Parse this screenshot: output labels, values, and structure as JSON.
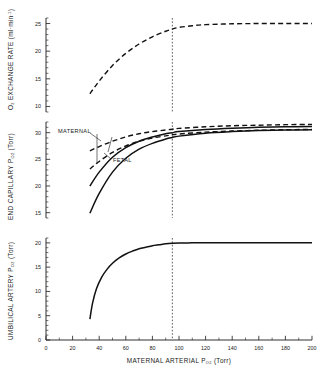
{
  "figure": {
    "name": "maternal-fetal-oxygen-transfer-figure",
    "background": "#ffffff",
    "ink": "#111111"
  },
  "xaxis": {
    "label_main": "MATERNAL ARTERIAL P",
    "label_sub": "O",
    "label_sub2": "2",
    "label_unit": "(Torr)",
    "full_label": "MATERNAL ARTERIAL PO2 (Torr)",
    "min": 0,
    "max": 200,
    "ticks": [
      0,
      20,
      40,
      60,
      80,
      100,
      120,
      140,
      160,
      180,
      200
    ],
    "tick_labels": [
      "0",
      "20",
      "40",
      "60",
      "80",
      "100",
      "120",
      "140",
      "160",
      "180",
      "200"
    ],
    "minor_step": 10
  },
  "reference_line": {
    "name": "normal-maternal-po2-reference",
    "x": 95,
    "style": "dotted"
  },
  "panels": [
    {
      "id": "top",
      "name": "o2-exchange-rate-panel",
      "ylabel_main": "O",
      "ylabel_sub": "2",
      "ylabel_rest": " EXCHANGE RATE (ml",
      "ylabel_unit": "min",
      "ylabel_exp": "-1",
      "ylabel_tail": ")",
      "full_ylabel": "O2 EXCHANGE RATE (ml·min-1)",
      "ymin": 9,
      "ymax": 26,
      "ticks": [
        10,
        15,
        20,
        25
      ],
      "tick_labels": [
        "10",
        "15",
        "20",
        "25"
      ],
      "minor_step": 1
    },
    {
      "id": "middle",
      "name": "end-capillary-po2-panel",
      "ylabel_main": "END CAPILLARY P",
      "ylabel_sub": "O",
      "ylabel_sub2": "2",
      "ylabel_unit": "(Torr)",
      "full_ylabel": "END CAPILLARY PO2 (Torr)",
      "ymin": 14,
      "ymax": 32,
      "ticks": [
        15,
        20,
        25,
        30
      ],
      "tick_labels": [
        "15",
        "20",
        "25",
        "30"
      ],
      "minor_step": 1
    },
    {
      "id": "bottom",
      "name": "umbilical-artery-po2-panel",
      "ylabel_main": "UMBILICAL ARTERY P",
      "ylabel_sub": "O",
      "ylabel_sub2": "2",
      "ylabel_unit": "(Torr)",
      "full_ylabel": "UMBILICAL ARTERY PO2 (Torr)",
      "ymin": 0,
      "ymax": 21,
      "ticks": [
        0,
        5,
        10,
        15,
        20
      ],
      "tick_labels": [
        "0",
        "5",
        "10",
        "15",
        "20"
      ],
      "minor_step": 1
    }
  ],
  "annotations": [
    {
      "name": "maternal-label",
      "text": "MATERNAL",
      "x": 58,
      "y": 131
    },
    {
      "name": "fetal-label",
      "text": "FETAL",
      "x": 113,
      "y": 160
    }
  ],
  "chart_data": {
    "type": "line",
    "title": "",
    "xlabel": "MATERNAL ARTERIAL PO2 (Torr)",
    "xlim": [
      0,
      200
    ],
    "grid": false,
    "legend": "inline-annotations",
    "reference_line_x": 95,
    "panels": [
      {
        "id": "top",
        "ylabel": "O2 EXCHANGE RATE (ml·min-1)",
        "ylim": [
          9,
          26
        ],
        "yticks": [
          10,
          15,
          20,
          25
        ],
        "series": [
          {
            "name": "O2 exchange rate",
            "style": "dashed",
            "x": [
              33,
              40,
              50,
              60,
              70,
              80,
              90,
              95,
              100,
              110,
              120,
              140,
              160,
              180,
              200
            ],
            "values": [
              12.3,
              14.6,
              17.4,
              19.6,
              21.3,
              22.6,
              23.6,
              24.0,
              24.3,
              24.6,
              24.8,
              24.95,
              25.0,
              25.0,
              25.0
            ]
          }
        ]
      },
      {
        "id": "middle",
        "ylabel": "END CAPILLARY PO2 (Torr)",
        "ylim": [
          14,
          32
        ],
        "yticks": [
          15,
          20,
          25,
          30
        ],
        "series": [
          {
            "name": "MATERNAL upper",
            "style": "dashed",
            "x": [
              33,
              40,
              50,
              60,
              70,
              80,
              90,
              95,
              100,
              120,
              140,
              160,
              180,
              200
            ],
            "values": [
              26.6,
              27.4,
              28.4,
              29.2,
              29.8,
              30.2,
              30.5,
              30.65,
              30.8,
              31.1,
              31.3,
              31.4,
              31.5,
              31.55
            ]
          },
          {
            "name": "MATERNAL lower",
            "style": "dashed",
            "x": [
              33,
              40,
              50,
              60,
              70,
              80,
              90,
              95,
              100,
              120,
              140,
              160,
              180,
              200
            ],
            "values": [
              23.2,
              24.6,
              26.3,
              27.5,
              28.4,
              29.0,
              29.4,
              29.6,
              29.75,
              30.1,
              30.3,
              30.45,
              30.55,
              30.6
            ]
          },
          {
            "name": "FETAL upper",
            "style": "solid",
            "x": [
              33,
              40,
              50,
              60,
              70,
              80,
              90,
              95,
              100,
              120,
              140,
              160,
              180,
              200
            ],
            "values": [
              20.0,
              22.6,
              25.4,
              27.2,
              28.4,
              29.2,
              29.8,
              30.0,
              30.2,
              30.6,
              30.85,
              31.0,
              31.1,
              31.15
            ]
          },
          {
            "name": "FETAL lower",
            "style": "solid",
            "x": [
              33,
              40,
              50,
              60,
              70,
              80,
              90,
              95,
              100,
              120,
              140,
              160,
              180,
              200
            ],
            "values": [
              14.9,
              18.6,
              22.6,
              25.2,
              26.9,
              28.0,
              28.8,
              29.1,
              29.35,
              29.9,
              30.2,
              30.4,
              30.5,
              30.55
            ]
          }
        ]
      },
      {
        "id": "bottom",
        "ylabel": "UMBILICAL ARTERY PO2 (Torr)",
        "ylim": [
          0,
          21
        ],
        "yticks": [
          0,
          5,
          10,
          15,
          20
        ],
        "series": [
          {
            "name": "Umbilical artery PO2",
            "style": "solid",
            "x": [
              33,
              35,
              38,
              42,
              46,
              50,
              55,
              60,
              65,
              70,
              75,
              80,
              85,
              90,
              95,
              100,
              110,
              120,
              140,
              160,
              180,
              200
            ],
            "values": [
              4.3,
              7.6,
              10.6,
              13.0,
              14.6,
              15.8,
              16.9,
              17.7,
              18.3,
              18.8,
              19.1,
              19.4,
              19.6,
              19.8,
              19.9,
              19.95,
              20.0,
              20.0,
              20.0,
              20.0,
              20.0,
              20.0
            ]
          }
        ]
      }
    ]
  }
}
